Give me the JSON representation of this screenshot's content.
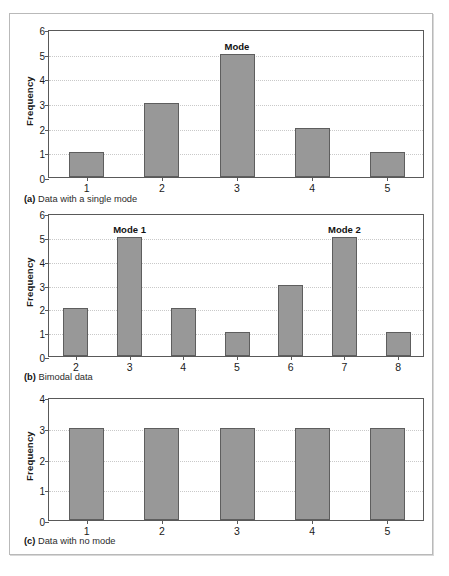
{
  "figure": {
    "bar_color": "#989898",
    "bar_border_color": "#5e5e5e",
    "axis_color": "#595959",
    "grid_color": "#c9c9c9"
  },
  "panels": [
    {
      "id": "a",
      "caption_label": "(a)",
      "caption_text": " Data with a single mode",
      "ylabel": "Frequency",
      "yticks": [
        "0",
        "1",
        "2",
        "3",
        "4",
        "5",
        "6"
      ],
      "xticks": [
        "1",
        "2",
        "3",
        "4",
        "5"
      ],
      "annotations": [
        {
          "text": "Mode",
          "category": "3"
        }
      ]
    },
    {
      "id": "b",
      "caption_label": "(b)",
      "caption_text": " Bimodal data",
      "ylabel": "Frequency",
      "yticks": [
        "0",
        "1",
        "2",
        "3",
        "4",
        "5",
        "6"
      ],
      "xticks": [
        "2",
        "3",
        "4",
        "5",
        "6",
        "7",
        "8"
      ],
      "annotations": [
        {
          "text": "Mode 1",
          "category": "3"
        },
        {
          "text": "Mode 2",
          "category": "7"
        }
      ]
    },
    {
      "id": "c",
      "caption_label": "(c)",
      "caption_text": " Data with no mode",
      "ylabel": "Frequency",
      "yticks": [
        "0",
        "1",
        "2",
        "3",
        "4"
      ],
      "xticks": [
        "1",
        "2",
        "3",
        "4",
        "5"
      ],
      "annotations": []
    }
  ],
  "chart_data": [
    {
      "type": "bar",
      "panel": "a",
      "title": "(a) Data with a single mode",
      "categories": [
        "1",
        "2",
        "3",
        "4",
        "5"
      ],
      "values": [
        1,
        3,
        5,
        2,
        1
      ],
      "xlabel": "",
      "ylabel": "Frequency",
      "ylim": [
        0,
        6
      ],
      "ytick_step": 1,
      "grid": true,
      "grid_axis": "y",
      "legend": false,
      "annotations": [
        {
          "text": "Mode",
          "category": "3",
          "value": 5
        }
      ]
    },
    {
      "type": "bar",
      "panel": "b",
      "title": "(b) Bimodal data",
      "categories": [
        "2",
        "3",
        "4",
        "5",
        "6",
        "7",
        "8"
      ],
      "values": [
        2,
        5,
        2,
        1,
        3,
        5,
        1
      ],
      "xlabel": "",
      "ylabel": "Frequency",
      "ylim": [
        0,
        6
      ],
      "ytick_step": 1,
      "grid": true,
      "grid_axis": "y",
      "legend": false,
      "annotations": [
        {
          "text": "Mode 1",
          "category": "3",
          "value": 5
        },
        {
          "text": "Mode 2",
          "category": "7",
          "value": 5
        }
      ]
    },
    {
      "type": "bar",
      "panel": "c",
      "title": "(c) Data with no mode",
      "categories": [
        "1",
        "2",
        "3",
        "4",
        "5"
      ],
      "values": [
        3,
        3,
        3,
        3,
        3
      ],
      "xlabel": "",
      "ylabel": "Frequency",
      "ylim": [
        0,
        4
      ],
      "ytick_step": 1,
      "grid": true,
      "grid_axis": "y",
      "legend": false,
      "annotations": []
    }
  ]
}
